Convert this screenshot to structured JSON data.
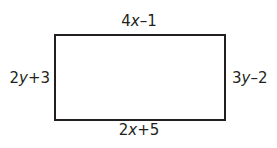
{
  "diagram": {
    "shape": "rectangle",
    "sides": {
      "top": {
        "coef": "4",
        "var": "x",
        "rest": "–1"
      },
      "bottom": {
        "coef": "2",
        "var": "x",
        "rest": "+5"
      },
      "left": {
        "coef": "2",
        "var": "y",
        "rest": "+3"
      },
      "right": {
        "coef": "3",
        "var": "y",
        "rest": "–2"
      }
    },
    "labels": {
      "top": "4x–1",
      "bottom": "2x+5",
      "left": "2y+3",
      "right": "3y–2"
    },
    "stroke_color": "#231f20"
  }
}
